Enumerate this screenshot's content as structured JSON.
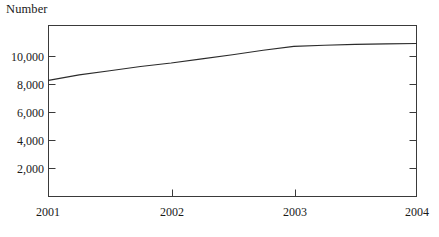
{
  "chart_data": {
    "type": "line",
    "title": "",
    "ylabel": "Number",
    "xlabel": "",
    "x": [
      2001,
      2002,
      2003,
      2004
    ],
    "xtick_labels": [
      "2001",
      "2002",
      "2003",
      "2004"
    ],
    "ytick_labels": [
      "2,000",
      "4,000",
      "6,000",
      "8,000",
      "10,000"
    ],
    "ytick_values": [
      2000,
      4000,
      6000,
      8000,
      10000
    ],
    "ylim": [
      0,
      12300
    ],
    "xlim": [
      2001,
      2004
    ],
    "grid": false,
    "legend": false,
    "series": [
      {
        "name": "Number",
        "values": [
          8350,
          9600,
          10800,
          11000
        ],
        "points": [
          {
            "x": 2001.0,
            "y": 8350
          },
          {
            "x": 2001.25,
            "y": 8750
          },
          {
            "x": 2001.5,
            "y": 9050
          },
          {
            "x": 2001.75,
            "y": 9350
          },
          {
            "x": 2002.0,
            "y": 9600
          },
          {
            "x": 2002.25,
            "y": 9900
          },
          {
            "x": 2002.5,
            "y": 10200
          },
          {
            "x": 2002.75,
            "y": 10520
          },
          {
            "x": 2003.0,
            "y": 10800
          },
          {
            "x": 2003.25,
            "y": 10880
          },
          {
            "x": 2003.5,
            "y": 10940
          },
          {
            "x": 2003.75,
            "y": 10980
          },
          {
            "x": 2004.0,
            "y": 11000
          }
        ]
      }
    ],
    "colors": {
      "line": "#2b2b2b",
      "axis": "#3a3a3a",
      "text": "#1a1a1a",
      "background": "#ffffff"
    }
  },
  "axes": {
    "y_title": "Number"
  }
}
